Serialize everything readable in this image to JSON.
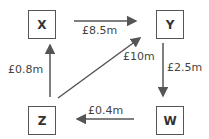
{
  "nodes": {
    "x": {
      "label": "X"
    },
    "y": {
      "label": "Y"
    },
    "z": {
      "label": "Z"
    },
    "w": {
      "label": "W"
    }
  },
  "edges": [
    {
      "from": "X",
      "to": "Y",
      "label": "£8.5m"
    },
    {
      "from": "Z",
      "to": "Y",
      "label": "£10m"
    },
    {
      "from": "Y",
      "to": "W",
      "label": "£2.5m"
    },
    {
      "from": "W",
      "to": "Z",
      "label": "£0.4m"
    },
    {
      "from": "Z",
      "to": "X",
      "label": "£0.8m"
    }
  ],
  "colors": {
    "line": "#555555",
    "text": "#444444"
  }
}
